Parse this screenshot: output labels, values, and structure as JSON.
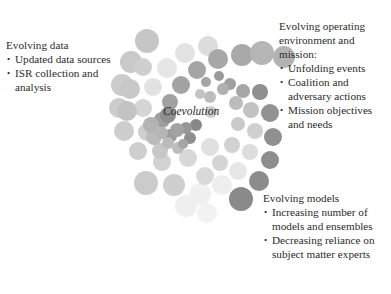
{
  "center": {
    "label": "Coevolution"
  },
  "blocks": {
    "data": {
      "title": "Evolving data",
      "items": [
        "Updated data sources",
        "ISR collection and analysis"
      ]
    },
    "environment": {
      "title": "Evolving operating environment and mission:",
      "items": [
        "Unfolding events",
        "Coalition and adversary actions",
        "Mission objectives and needs"
      ]
    },
    "models": {
      "title": "Evolving models",
      "items": [
        "Increasing number of models and ensembles",
        "Decreasing reliance on subject matter experts"
      ]
    }
  },
  "colors": {
    "dark": "#8c8c8c",
    "mid": "#a8a8a8",
    "light": "#c9c9c9",
    "faint": "#e6e6e6",
    "text": "#2b2b2b"
  },
  "circles": [
    {
      "x": 147,
      "y": 41,
      "r": 12,
      "c": "#c6c6c6"
    },
    {
      "x": 131,
      "y": 62,
      "r": 11,
      "c": "#c9c9c9"
    },
    {
      "x": 122,
      "y": 85,
      "r": 11,
      "c": "#cbcbcb"
    },
    {
      "x": 119,
      "y": 108,
      "r": 10,
      "c": "#cccccc"
    },
    {
      "x": 124,
      "y": 131,
      "r": 10,
      "c": "#cdcdcd"
    },
    {
      "x": 138,
      "y": 151,
      "r": 9,
      "c": "#cecece"
    },
    {
      "x": 162,
      "y": 162,
      "r": 9,
      "c": "#d2d2d2"
    },
    {
      "x": 188,
      "y": 158,
      "r": 9,
      "c": "#d8d8d8"
    },
    {
      "x": 210,
      "y": 147,
      "r": 9,
      "c": "#e0e0e0"
    },
    {
      "x": 208,
      "y": 46,
      "r": 10,
      "c": "#dcdcdc"
    },
    {
      "x": 185,
      "y": 53,
      "r": 10,
      "c": "#e3e3e3"
    },
    {
      "x": 167,
      "y": 68,
      "r": 10,
      "c": "#e6e6e6"
    },
    {
      "x": 153,
      "y": 87,
      "r": 9,
      "c": "#e2e2e2"
    },
    {
      "x": 143,
      "y": 108,
      "r": 9,
      "c": "#d5d5d5"
    },
    {
      "x": 147,
      "y": 132,
      "r": 9,
      "c": "#cfcfcf"
    },
    {
      "x": 160,
      "y": 151,
      "r": 8,
      "c": "#c8c8c8"
    },
    {
      "x": 242,
      "y": 55,
      "r": 11,
      "c": "#a9a9a9"
    },
    {
      "x": 218,
      "y": 59,
      "r": 10,
      "c": "#a7a7a7"
    },
    {
      "x": 197,
      "y": 70,
      "r": 9,
      "c": "#a5a5a5"
    },
    {
      "x": 181,
      "y": 85,
      "r": 9,
      "c": "#a3a3a3"
    },
    {
      "x": 170,
      "y": 102,
      "r": 8,
      "c": "#a1a1a1"
    },
    {
      "x": 162,
      "y": 120,
      "r": 8,
      "c": "#9f9f9f"
    },
    {
      "x": 170,
      "y": 136,
      "r": 7,
      "c": "#9d9d9d"
    },
    {
      "x": 178,
      "y": 148,
      "r": 6,
      "c": "#bdbdbd"
    },
    {
      "x": 262,
      "y": 53,
      "r": 12,
      "c": "#b5b5b5"
    },
    {
      "x": 284,
      "y": 57,
      "r": 11,
      "c": "#b3b3b3"
    },
    {
      "x": 260,
      "y": 92,
      "r": 8,
      "c": "#8f8f8f"
    },
    {
      "x": 270,
      "y": 113,
      "r": 9,
      "c": "#929292"
    },
    {
      "x": 273,
      "y": 137,
      "r": 9,
      "c": "#909090"
    },
    {
      "x": 270,
      "y": 160,
      "r": 9,
      "c": "#8e8e8e"
    },
    {
      "x": 259,
      "y": 181,
      "r": 10,
      "c": "#8c8c8c"
    },
    {
      "x": 241,
      "y": 199,
      "r": 12,
      "c": "#8a8a8a"
    },
    {
      "x": 243,
      "y": 91,
      "r": 7,
      "c": "#a6a6a6"
    },
    {
      "x": 251,
      "y": 110,
      "r": 8,
      "c": "#c2c2c2"
    },
    {
      "x": 255,
      "y": 131,
      "r": 8,
      "c": "#d0d0d0"
    },
    {
      "x": 250,
      "y": 152,
      "r": 8,
      "c": "#dddddd"
    },
    {
      "x": 238,
      "y": 171,
      "r": 9,
      "c": "#e7e7e7"
    },
    {
      "x": 222,
      "y": 185,
      "r": 10,
      "c": "#eeeeee"
    },
    {
      "x": 200,
      "y": 194,
      "r": 11,
      "c": "#f0f0f0"
    },
    {
      "x": 230,
      "y": 84,
      "r": 6,
      "c": "#a0a0a0"
    },
    {
      "x": 236,
      "y": 103,
      "r": 7,
      "c": "#bcbcbc"
    },
    {
      "x": 238,
      "y": 124,
      "r": 7,
      "c": "#cacaca"
    },
    {
      "x": 232,
      "y": 145,
      "r": 8,
      "c": "#d1d1d1"
    },
    {
      "x": 220,
      "y": 163,
      "r": 8,
      "c": "#d4d4d4"
    },
    {
      "x": 205,
      "y": 176,
      "r": 9,
      "c": "#d9d9d9"
    },
    {
      "x": 219,
      "y": 76,
      "r": 5,
      "c": "#9a9a9a"
    },
    {
      "x": 223,
      "y": 89,
      "r": 6,
      "c": "#b0b0b0"
    },
    {
      "x": 206,
      "y": 82,
      "r": 5,
      "c": "#a5a5a5"
    },
    {
      "x": 210,
      "y": 97,
      "r": 6,
      "c": "#bdbdbd"
    },
    {
      "x": 211,
      "y": 112,
      "r": 6,
      "c": "#cccccc"
    },
    {
      "x": 200,
      "y": 94,
      "r": 5,
      "c": "#c3c3c3"
    },
    {
      "x": 174,
      "y": 185,
      "r": 11,
      "c": "#cfcfcf"
    },
    {
      "x": 146,
      "y": 183,
      "r": 12,
      "c": "#cbcbcb"
    },
    {
      "x": 186,
      "y": 206,
      "r": 11,
      "c": "#efefef"
    },
    {
      "x": 207,
      "y": 213,
      "r": 10,
      "c": "#f2f2f2"
    },
    {
      "x": 127,
      "y": 111,
      "r": 10,
      "c": "#c3c3c3"
    },
    {
      "x": 130,
      "y": 89,
      "r": 10,
      "c": "#c8c8c8"
    },
    {
      "x": 143,
      "y": 67,
      "r": 9,
      "c": "#cfcfcf"
    },
    {
      "x": 154,
      "y": 137,
      "r": 8,
      "c": "#bbbbbb"
    },
    {
      "x": 190,
      "y": 138,
      "r": 6,
      "c": "#8f8f8f"
    },
    {
      "x": 196,
      "y": 125,
      "r": 6,
      "c": "#888888"
    },
    {
      "x": 186,
      "y": 128,
      "r": 6,
      "c": "#979797"
    },
    {
      "x": 177,
      "y": 130,
      "r": 7,
      "c": "#a2a2a2"
    },
    {
      "x": 183,
      "y": 144,
      "r": 5,
      "c": "#a5a5a5"
    },
    {
      "x": 168,
      "y": 143,
      "r": 6,
      "c": "#bbbbbb"
    },
    {
      "x": 162,
      "y": 133,
      "r": 6,
      "c": "#b5b5b5"
    },
    {
      "x": 151,
      "y": 125,
      "r": 8,
      "c": "#b3b3b3"
    },
    {
      "x": 168,
      "y": 115,
      "r": 8,
      "c": "#8f8f8f"
    }
  ]
}
